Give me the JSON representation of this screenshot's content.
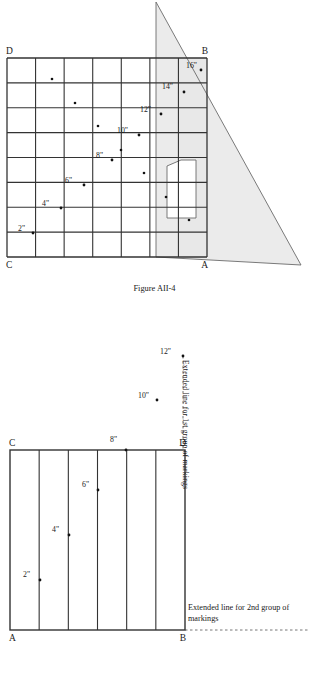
{
  "figure_top": {
    "caption": "Figure AII-4",
    "corner_labels": {
      "top_left": "D",
      "top_right": "B",
      "bottom_left": "C",
      "bottom_right": "A"
    },
    "grid": {
      "columns": 7,
      "rows": 8,
      "x": 7,
      "y": 58,
      "width": 200,
      "height": 199
    },
    "shaded_band": {
      "from_column": 6,
      "to_column": 7,
      "fill": "#e8e8e8"
    },
    "triangle": {
      "apex": [
        156,
        2
      ],
      "bottom_left": [
        156,
        257
      ],
      "bottom_right": [
        301,
        265
      ],
      "fill": "#e8e8e8",
      "stroke": "#6b6b6b"
    },
    "triangle_cutout": {
      "points": "181,160 196,160 196,218 167,218 167,166",
      "fill": "#ffffff",
      "stroke": "#6b6b6b"
    },
    "markings": [
      {
        "label": "2\"",
        "label_x": 18,
        "label_y": 231,
        "dot_x": 33,
        "dot_y": 233
      },
      {
        "label": "4\"",
        "label_x": 42,
        "label_y": 206,
        "dot_x": 61,
        "dot_y": 208
      },
      {
        "label": "6\"",
        "label_x": 65,
        "label_y": 183,
        "dot_x": 84,
        "dot_y": 185
      },
      {
        "label": "8\"",
        "label_x": 96,
        "label_y": 158,
        "dot_x": 112,
        "dot_y": 160
      },
      {
        "label": "10\"",
        "label_x": 117,
        "label_y": 133,
        "dot_x": 139,
        "dot_y": 135
      },
      {
        "label": "12\"",
        "label_x": 140,
        "label_y": 112,
        "dot_x": 161,
        "dot_y": 114
      },
      {
        "label": "14\"",
        "label_x": 162,
        "label_y": 89,
        "dot_x": 184,
        "dot_y": 92
      },
      {
        "label": "16\"",
        "label_x": 186,
        "label_y": 68,
        "dot_x": 201,
        "dot_y": 70
      }
    ],
    "row_dots": [
      {
        "x": 52,
        "y": 79
      },
      {
        "x": 75,
        "y": 103
      },
      {
        "x": 98,
        "y": 126
      },
      {
        "x": 121,
        "y": 150
      },
      {
        "x": 144,
        "y": 173
      },
      {
        "x": 166,
        "y": 197
      },
      {
        "x": 189,
        "y": 220
      }
    ]
  },
  "figure_bottom": {
    "corner_labels": {
      "top_left": "C",
      "top_right": "D",
      "bottom_left": "A",
      "bottom_right": "B"
    },
    "rect": {
      "x": 10,
      "y": 120,
      "width": 175,
      "height": 180
    },
    "strips": 6,
    "extension_line_1st": {
      "label": "Extended line for 1st group of markings",
      "x": 183,
      "y_top": 26,
      "y_bottom": 120
    },
    "extension_line_2nd": {
      "label": "Extended line for 2nd group of markings",
      "y": 300,
      "x_left": 185,
      "x_right": 309,
      "label_x": 188,
      "label_y": 272
    },
    "markings": [
      {
        "label": "2\"",
        "label_x": 23,
        "label_y": 247,
        "dot_x": 40,
        "dot_y": 250
      },
      {
        "label": "4\"",
        "label_x": 52,
        "label_y": 202,
        "dot_x": 69,
        "dot_y": 205
      },
      {
        "label": "6\"",
        "label_x": 82,
        "label_y": 157,
        "dot_x": 98,
        "dot_y": 160
      },
      {
        "label": "8\"",
        "label_x": 110,
        "label_y": 112,
        "dot_x": 126,
        "dot_y": 120
      },
      {
        "label": "10\"",
        "label_x": 138,
        "label_y": 68,
        "dot_x": 157,
        "dot_y": 70
      },
      {
        "label": "12\"",
        "label_x": 160,
        "label_y": 24,
        "dot_x": 183,
        "dot_y": 26
      }
    ]
  },
  "colors": {
    "line": "#333333",
    "thin_line": "#555555",
    "shade": "#e8e8e8",
    "triangle_stroke": "#6b6b6b",
    "dot": "#111111"
  }
}
